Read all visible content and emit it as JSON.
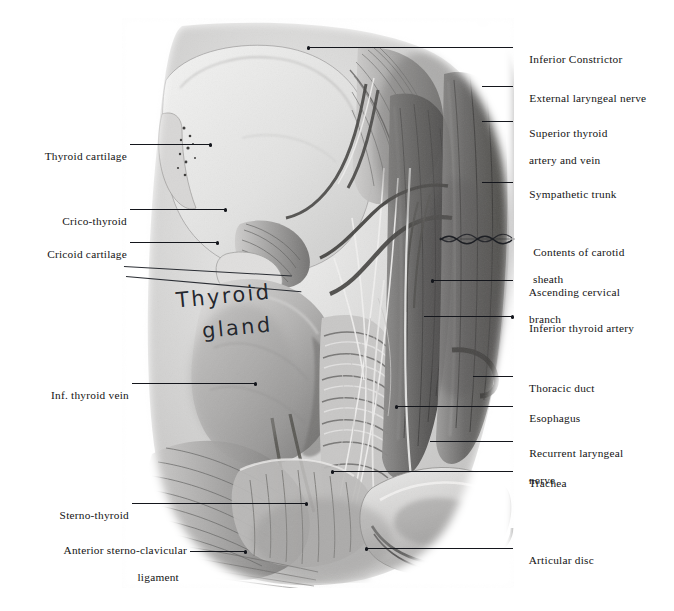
{
  "plate": {
    "title": "Dissection of the thyroid gland region of the neck",
    "background_color": "#ffffff",
    "ink_color": "#14161c",
    "overlay_caption": {
      "line1": "Thyroid",
      "line2": "gland",
      "style": "handwritten"
    }
  },
  "labels_right": [
    {
      "id": "inferior-constrictor",
      "line1": "Inferior Constrictor",
      "line2": ""
    },
    {
      "id": "external-laryngeal-nerve",
      "line1": "External laryngeal nerve",
      "line2": ""
    },
    {
      "id": "superior-thyroid-vessels",
      "line1": "Superior thyroid",
      "line2": "artery and vein"
    },
    {
      "id": "sympathetic-trunk",
      "line1": "Sympathetic trunk",
      "line2": ""
    },
    {
      "id": "carotid-sheath-contents",
      "line1": "Contents of carotid",
      "line2": "sheath"
    },
    {
      "id": "ascending-cervical-branch",
      "line1": "Ascending cervical",
      "line2": "branch"
    },
    {
      "id": "inferior-thyroid-artery",
      "line1": "Inferior thyroid artery",
      "line2": ""
    },
    {
      "id": "thoracic-duct",
      "line1": "Thoracic duct",
      "line2": ""
    },
    {
      "id": "esophagus",
      "line1": "Esophagus",
      "line2": ""
    },
    {
      "id": "recurrent-laryngeal-nerve",
      "line1": "Recurrent laryngeal",
      "line2": "nerve"
    },
    {
      "id": "trachea",
      "line1": "Trachea",
      "line2": ""
    },
    {
      "id": "articular-disc",
      "line1": "Articular disc",
      "line2": ""
    }
  ],
  "labels_left": [
    {
      "id": "thyroid-cartilage",
      "line1": "Thyroid cartilage",
      "line2": ""
    },
    {
      "id": "crico-thyroid",
      "line1": "Crico-thyroid",
      "line2": ""
    },
    {
      "id": "cricoid-cartilage",
      "line1": "Cricoid cartilage",
      "line2": ""
    },
    {
      "id": "inf-thyroid-vein",
      "line1": "Inf. thyroid vein",
      "line2": ""
    },
    {
      "id": "sterno-thyroid",
      "line1": "Sterno-thyroid",
      "line2": ""
    },
    {
      "id": "anterior-sternoclavicular-ligament",
      "line1": "Anterior sterno-clavicular",
      "line2": "ligament"
    }
  ]
}
